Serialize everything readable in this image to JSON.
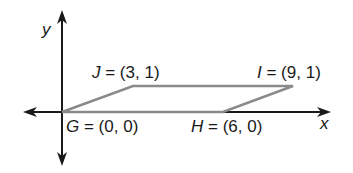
{
  "diagram": {
    "type": "coordinate-plane-parallelogram",
    "axes": {
      "x_label": "x",
      "y_label": "y"
    },
    "points": [
      {
        "name": "G",
        "coords": "(0, 0)",
        "label": "G = (0, 0)"
      },
      {
        "name": "H",
        "coords": "(6, 0)",
        "label": "H = (6, 0)"
      },
      {
        "name": "I",
        "coords": "(9, 1)",
        "label": "I = (9, 1)"
      },
      {
        "name": "J",
        "coords": "(3, 1)",
        "label": "J = (3, 1)"
      }
    ],
    "colors": {
      "axis": "#1a1a1a",
      "shape": "#8a8a8a"
    }
  },
  "labels": {
    "x": "x",
    "y": "y",
    "G_name": "G",
    "G_rest": " = (0, 0)",
    "H_name": "H",
    "H_rest": " = (6, 0)",
    "I_name": "I",
    "I_rest": " = (9, 1)",
    "J_name": "J",
    "J_rest": " = (3, 1)"
  }
}
